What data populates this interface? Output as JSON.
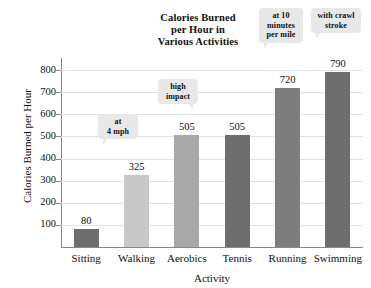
{
  "chart_data": {
    "type": "bar",
    "title": "Calories Burned per Hour in Various Activities",
    "title_lines": [
      "Calories Burned",
      "per Hour in",
      "Various Activities"
    ],
    "xlabel": "Activity",
    "ylabel": "Calories Burned per Hour",
    "categories": [
      "Sitting",
      "Walking",
      "Aerobics",
      "Tennis",
      "Running",
      "Swimming"
    ],
    "values": [
      80,
      325,
      505,
      505,
      720,
      790
    ],
    "value_labels": [
      "80",
      "325",
      "505",
      "505",
      "720",
      "790"
    ],
    "ylim": [
      0,
      800
    ],
    "yticks": [
      100,
      200,
      300,
      400,
      500,
      600,
      700,
      800
    ],
    "ytick_labels": [
      "100",
      "200",
      "300",
      "400",
      "500",
      "600",
      "700",
      "800"
    ],
    "grid": true,
    "legend": "none",
    "bar_colors": [
      "#6e6e6e",
      "#c8c8c8",
      "#a8a8a8",
      "#6e6e6e",
      "#7d7d7d",
      "#6e6e6e"
    ],
    "annotations": [
      {
        "category": "Walking",
        "lines": [
          "at",
          "4 mph"
        ],
        "text": "at 4 mph"
      },
      {
        "category": "Aerobics",
        "lines": [
          "high",
          "impact"
        ],
        "text": "high impact"
      },
      {
        "category": "Running",
        "lines": [
          "at 10",
          "minutes",
          "per mile"
        ],
        "text": "at 10 minutes per mile"
      },
      {
        "category": "Swimming",
        "lines": [
          "with crawl",
          "stroke"
        ],
        "text": "with crawl stroke"
      }
    ]
  },
  "colors": {
    "axis": "#888888",
    "grid": "#e2e2e2",
    "callout_bg": "#e8e8e8",
    "text": "#111111",
    "background": "#ffffff"
  }
}
